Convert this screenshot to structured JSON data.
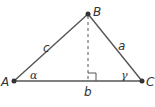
{
  "diagram": {
    "type": "triangle",
    "colors": {
      "stroke": "#555555",
      "text": "#333333",
      "background": "#ffffff"
    },
    "vertices": [
      {
        "id": "A",
        "label": "A",
        "x": 14,
        "y": 81
      },
      {
        "id": "B",
        "label": "B",
        "x": 88,
        "y": 14
      },
      {
        "id": "C",
        "label": "C",
        "x": 142,
        "y": 81
      }
    ],
    "sides": [
      {
        "id": "c",
        "label": "c",
        "from": "A",
        "to": "B"
      },
      {
        "id": "a",
        "label": "a",
        "from": "B",
        "to": "C"
      },
      {
        "id": "b",
        "label": "b",
        "from": "A",
        "to": "C"
      }
    ],
    "angles": [
      {
        "id": "alpha",
        "label": "α",
        "at": "A"
      },
      {
        "id": "gamma",
        "label": "γ",
        "at": "C"
      }
    ],
    "altitude": {
      "from": "B",
      "foot_x": 88,
      "foot_y": 81,
      "style": "dashed",
      "right_angle_marker": true
    }
  }
}
